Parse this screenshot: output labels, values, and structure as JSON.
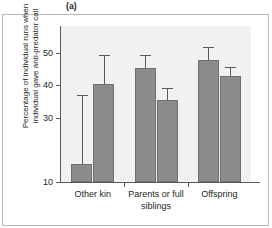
{
  "panel": {
    "label": "(a)"
  },
  "axes": {
    "ylabel_line1": "Percentage of individual runs when",
    "ylabel_line2": "individual gave anti-predator call",
    "yticks": [
      {
        "value": 50,
        "label": "50"
      },
      {
        "value": 40,
        "label": "40"
      },
      {
        "value": 30,
        "label": "30"
      },
      {
        "value": 10,
        "label": "10"
      }
    ],
    "xlabels": [
      {
        "line1": "Other kin",
        "line2": ""
      },
      {
        "line1": "Parents or full",
        "line2": "siblings"
      },
      {
        "line1": "Offspring",
        "line2": ""
      }
    ]
  },
  "colors": {
    "bar_fill": "#8c8c8c",
    "bar_edge": "#6e6e6e",
    "plot_background": "#f1f1f1",
    "axis": "#58595b",
    "frame": "#b9b9b9",
    "text": "#231f20"
  },
  "chart_data": {
    "type": "bar",
    "title": "(a)",
    "xlabel": "",
    "ylabel": "Percentage of individual runs when individual gave anti-predator call",
    "ylim": [
      10,
      55
    ],
    "grid": false,
    "legend": "none",
    "categories": [
      "Other kin",
      "Parents or full siblings",
      "Offspring"
    ],
    "series": [
      {
        "name": "bar-1",
        "values": [
          15.5,
          45.4,
          48.0
        ],
        "err_upper": [
          37.0,
          49.3,
          52.0
        ],
        "err_lower": [
          15.5,
          45.4,
          48.0
        ]
      },
      {
        "name": "bar-2",
        "values": [
          40.3,
          35.5,
          43.0
        ],
        "err_upper": [
          49.5,
          39.3,
          45.8
        ],
        "err_lower": [
          40.3,
          35.5,
          43.0
        ]
      }
    ]
  }
}
